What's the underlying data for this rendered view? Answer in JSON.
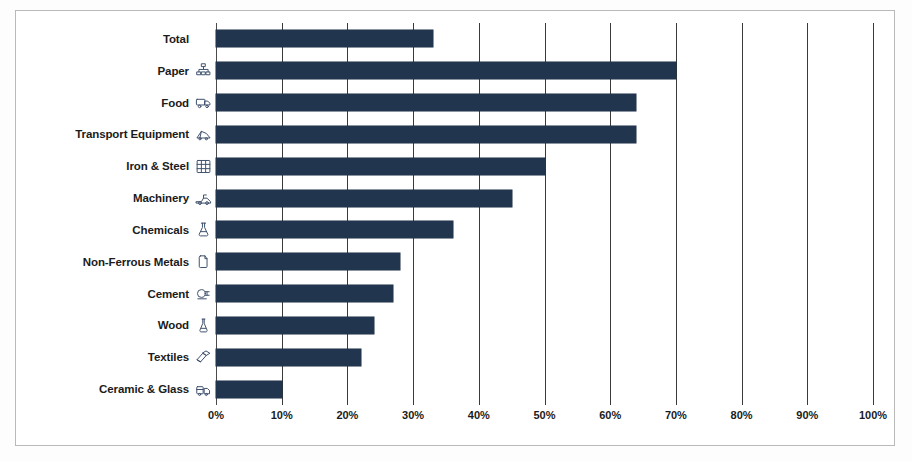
{
  "chart_data": {
    "type": "bar",
    "orientation": "horizontal",
    "title": "",
    "xlabel": "",
    "ylabel": "",
    "xlim": [
      0,
      100
    ],
    "grid": true,
    "legend": "none",
    "bar_color": "#22354f",
    "categories": [
      "Total",
      "Paper",
      "Food",
      "Transport Equipment",
      "Iron & Steel",
      "Machinery",
      "Chemicals",
      "Non-Ferrous Metals",
      "Cement",
      "Wood",
      "Textiles",
      "Ceramic & Glass"
    ],
    "category_icons": [
      "none",
      "paper-hierarchy-icon",
      "food-truck-icon",
      "transport-equipment-icon",
      "iron-steel-grid-icon",
      "machinery-icon",
      "chemicals-flask-icon",
      "non-ferrous-metals-icon",
      "cement-mixer-icon",
      "wood-flask-icon",
      "textiles-icon",
      "ceramic-glass-icon"
    ],
    "values": [
      33,
      70,
      64,
      64,
      50,
      45,
      36,
      28,
      27,
      24,
      22,
      10
    ],
    "value_unit": "%",
    "xticks": [
      0,
      10,
      20,
      30,
      40,
      50,
      60,
      70,
      80,
      90,
      100
    ],
    "xticklabels": [
      "0%",
      "10%",
      "20%",
      "30%",
      "40%",
      "50%",
      "60%",
      "70%",
      "80%",
      "90%",
      "100%"
    ]
  }
}
